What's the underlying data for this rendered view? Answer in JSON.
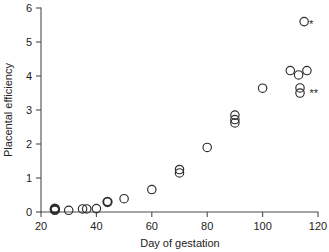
{
  "chart_data": {
    "type": "scatter",
    "title": "",
    "subtitle": "",
    "xlabel": "Day of gestation",
    "ylabel": "Placental efficiency",
    "xlim": [
      20,
      120
    ],
    "ylim": [
      0,
      6
    ],
    "xticks": [
      20,
      40,
      60,
      80,
      100,
      120
    ],
    "xtick_labels": [
      "20",
      "40",
      "60",
      "80",
      "100",
      "120"
    ],
    "yticks": [
      0,
      1,
      2,
      3,
      4,
      5,
      6
    ],
    "ytick_labels": [
      "0",
      "1",
      "2",
      "3",
      "4",
      "5",
      "6"
    ],
    "grid": false,
    "legend": "none",
    "marker": "open-circle",
    "marker_color": "#2b2b2b",
    "points": [
      {
        "x": 25,
        "y": 0.1,
        "emphasis": "bold"
      },
      {
        "x": 25,
        "y": 0.06,
        "emphasis": "bold"
      },
      {
        "x": 30,
        "y": 0.05,
        "emphasis": "normal"
      },
      {
        "x": 35,
        "y": 0.09,
        "emphasis": "normal"
      },
      {
        "x": 36.5,
        "y": 0.09,
        "emphasis": "normal"
      },
      {
        "x": 40,
        "y": 0.1,
        "emphasis": "normal"
      },
      {
        "x": 44,
        "y": 0.3,
        "emphasis": "bold"
      },
      {
        "x": 50,
        "y": 0.39,
        "emphasis": "normal"
      },
      {
        "x": 60,
        "y": 0.66,
        "emphasis": "normal"
      },
      {
        "x": 70,
        "y": 1.25,
        "emphasis": "normal"
      },
      {
        "x": 70,
        "y": 1.15,
        "emphasis": "normal"
      },
      {
        "x": 80,
        "y": 1.9,
        "emphasis": "normal"
      },
      {
        "x": 90,
        "y": 2.85,
        "emphasis": "normal"
      },
      {
        "x": 90,
        "y": 2.72,
        "emphasis": "normal"
      },
      {
        "x": 90,
        "y": 2.62,
        "emphasis": "normal"
      },
      {
        "x": 100,
        "y": 3.64,
        "emphasis": "normal"
      },
      {
        "x": 115,
        "y": 5.6,
        "emphasis": "normal"
      },
      {
        "x": 110,
        "y": 4.16,
        "emphasis": "normal"
      },
      {
        "x": 116,
        "y": 4.16,
        "emphasis": "normal"
      },
      {
        "x": 113,
        "y": 4.03,
        "emphasis": "normal"
      },
      {
        "x": 113.5,
        "y": 3.65,
        "emphasis": "normal"
      },
      {
        "x": 113.5,
        "y": 3.5,
        "emphasis": "normal"
      }
    ],
    "annotations": [
      {
        "text": "*",
        "x": 117.5,
        "y": 5.42
      },
      {
        "text": "**",
        "x": 118.5,
        "y": 3.38
      }
    ]
  }
}
